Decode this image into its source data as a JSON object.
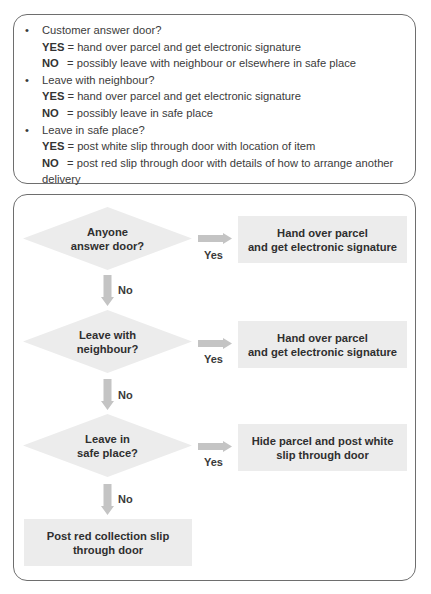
{
  "summary": {
    "items": [
      {
        "question": "Customer answer door?",
        "yes_key": "YES",
        "yes_text": "= hand over parcel and get electronic signature",
        "no_key": "NO",
        "no_text": "= possibly leave with neighbour or elsewhere in safe place"
      },
      {
        "question": "Leave with neighbour?",
        "yes_key": "YES",
        "yes_text": "= hand over parcel and get electronic signature",
        "no_key": "NO",
        "no_text": "= possibly leave in safe place"
      },
      {
        "question": "Leave in safe place?",
        "yes_key": "YES",
        "yes_text": "= post white slip through door with location of item",
        "no_key": "NO",
        "no_text": "= post red slip through door with details of how to arrange another",
        "no_text_cont": "delivery"
      }
    ],
    "bullet": "•"
  },
  "flowchart": {
    "decisions": [
      {
        "line1": "Anyone",
        "line2": "answer door?"
      },
      {
        "line1": "Leave with",
        "line2": "neighbour?"
      },
      {
        "line1": "Leave in",
        "line2": "safe place?"
      }
    ],
    "outcomes": [
      {
        "line1": "Hand over parcel",
        "line2": "and get electronic signature"
      },
      {
        "line1": "Hand over parcel",
        "line2": "and get electronic signature"
      },
      {
        "line1": "Hide parcel and post white",
        "line2": "slip through door"
      }
    ],
    "final": {
      "line1": "Post red collection slip",
      "line2": "through door"
    },
    "yes_label": "Yes",
    "no_label": "No",
    "colors": {
      "shape_fill": "#ececec",
      "arrow_fill": "#c4c4c4",
      "border": "#6e6e6e"
    }
  }
}
